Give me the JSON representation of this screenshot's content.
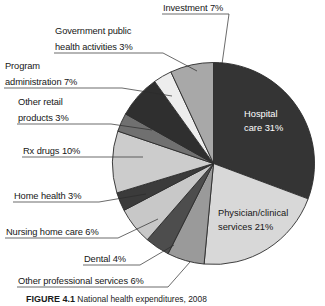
{
  "figure": {
    "caption_label": "FIGURE 4.1",
    "caption_text": "National health expenditures, 2008"
  },
  "colors": {
    "hospital_care": "#343434",
    "physician_clinical": "#d8d8d8",
    "other_professional": "#9a9a9a",
    "dental": "#4d4d4d",
    "nursing_home": "#c8c8c8",
    "home_health": "#3b3b3b",
    "rx_drugs": "#cccccc",
    "other_retail": "#707070",
    "program_administration": "#2f2f2f",
    "government_public_health": "#ededed",
    "investment": "#a8a8a8",
    "outline": "#2b2b2b",
    "leader_line": "#2b2b2b",
    "text_dark": "#161616",
    "text_light": "#ffffff",
    "background": "#ffffff"
  },
  "chart_data": {
    "type": "pie",
    "title": "National health expenditures, 2008",
    "unit": "percent",
    "total": 100,
    "start_angle_deg": 0,
    "direction": "clockwise",
    "legend": "none",
    "labels_inside": [
      "Hospital care 31%",
      "Physician/clinical services 21%"
    ],
    "categories": [
      "Hospital care",
      "Physician/clinical services",
      "Other professional services",
      "Dental",
      "Nursing home care",
      "Home health",
      "Rx drugs",
      "Other retail products",
      "Program administration",
      "Government public health activities",
      "Investment"
    ],
    "values": [
      31,
      21,
      6,
      4,
      6,
      3,
      10,
      3,
      7,
      3,
      7
    ],
    "slices": [
      {
        "name": "Hospital care",
        "value": 31,
        "label": "Hospital care 31%",
        "percent_text": "31%",
        "color": "#343434",
        "label_placement": "inside",
        "text_color": "#ffffff"
      },
      {
        "name": "Physician/clinical services",
        "value": 21,
        "label": "Physician/clinical services 21%",
        "percent_text": "21%",
        "color": "#d8d8d8",
        "label_placement": "inside",
        "text_color": "#161616"
      },
      {
        "name": "Other professional services",
        "value": 6,
        "label": "Other professional services 6%",
        "percent_text": "6%",
        "color": "#9a9a9a",
        "label_placement": "outside",
        "text_color": "#161616"
      },
      {
        "name": "Dental",
        "value": 4,
        "label": "Dental 4%",
        "percent_text": "4%",
        "color": "#4d4d4d",
        "label_placement": "outside",
        "text_color": "#161616"
      },
      {
        "name": "Nursing home care",
        "value": 6,
        "label": "Nursing home care 6%",
        "percent_text": "6%",
        "color": "#c8c8c8",
        "label_placement": "outside",
        "text_color": "#161616"
      },
      {
        "name": "Home health",
        "value": 3,
        "label": "Home health 3%",
        "percent_text": "3%",
        "color": "#3b3b3b",
        "label_placement": "outside",
        "text_color": "#161616"
      },
      {
        "name": "Rx drugs",
        "value": 10,
        "label": "Rx drugs 10%",
        "percent_text": "10%",
        "color": "#cccccc",
        "label_placement": "outside",
        "text_color": "#161616"
      },
      {
        "name": "Other retail products",
        "value": 3,
        "label": "Other retail products 3%",
        "percent_text": "3%",
        "color": "#707070",
        "label_placement": "outside",
        "text_color": "#161616"
      },
      {
        "name": "Program administration",
        "value": 7,
        "label": "Program administration 7%",
        "percent_text": "7%",
        "color": "#2f2f2f",
        "label_placement": "outside",
        "text_color": "#161616"
      },
      {
        "name": "Government public health activities",
        "value": 3,
        "label": "Government public health activities 3%",
        "percent_text": "3%",
        "color": "#ededed",
        "label_placement": "outside",
        "text_color": "#161616"
      },
      {
        "name": "Investment",
        "value": 7,
        "label": "Investment 7%",
        "percent_text": "7%",
        "color": "#a8a8a8",
        "label_placement": "outside",
        "text_color": "#161616"
      }
    ]
  },
  "callouts": {
    "investment": {
      "line1": "Investment 7%",
      "line2": ""
    },
    "government_public_health": {
      "line1": "Government public",
      "line2": "health activities 3%"
    },
    "program_administration": {
      "line1": "Program",
      "line2": "administration 7%"
    },
    "other_retail": {
      "line1": "Other retail",
      "line2": "products 3%"
    },
    "rx_drugs": {
      "line1": "Rx drugs 10%",
      "line2": ""
    },
    "home_health": {
      "line1": "Home health 3%",
      "line2": ""
    },
    "nursing_home": {
      "line1": "Nursing home care 6%",
      "line2": ""
    },
    "dental": {
      "line1": "Dental 4%",
      "line2": ""
    },
    "other_professional": {
      "line1": "Other professional services 6%",
      "line2": ""
    }
  },
  "inside_labels": {
    "hospital": {
      "line1": "Hospital",
      "line2": "care 31%"
    },
    "physician": {
      "line1": "Physician/clinical",
      "line2": "services 21%"
    }
  }
}
